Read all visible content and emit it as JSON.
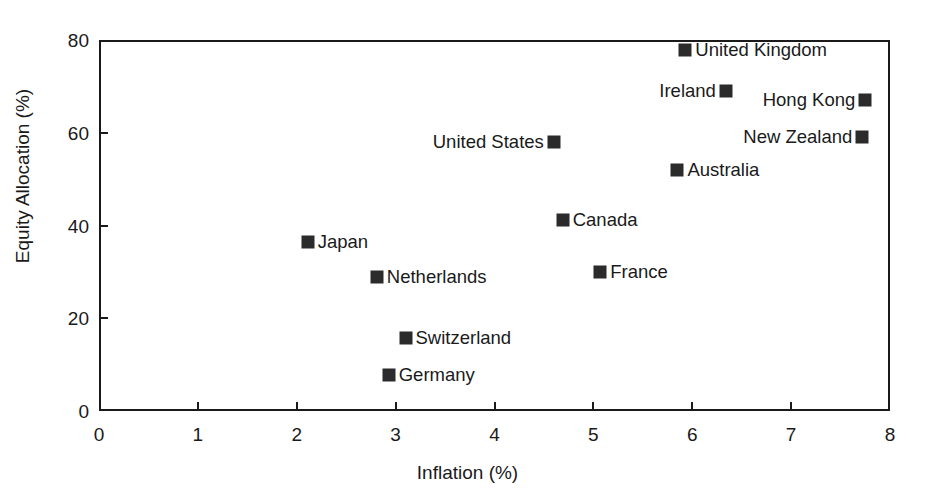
{
  "chart_data": {
    "type": "scatter",
    "title": "",
    "xlabel": "Inflation (%)",
    "ylabel": "Equity Allocation (%)",
    "xlim": [
      0,
      8
    ],
    "ylim": [
      0,
      80
    ],
    "xticks": [
      "0",
      "1",
      "2",
      "3",
      "4",
      "5",
      "6",
      "7",
      "8"
    ],
    "yticks": [
      "0",
      "20",
      "40",
      "60",
      "80"
    ],
    "grid": false,
    "legend": "none",
    "marker_shape": "square",
    "marker_color": "#2b2b2b",
    "points": [
      {
        "label": "United Kingdom",
        "x": 5.93,
        "y": 77.8,
        "label_side": "right"
      },
      {
        "label": "Ireland",
        "x": 6.34,
        "y": 69.0,
        "label_side": "left"
      },
      {
        "label": "Hong Kong",
        "x": 7.75,
        "y": 67.0,
        "label_side": "left"
      },
      {
        "label": "New Zealand",
        "x": 7.72,
        "y": 59.0,
        "label_side": "left"
      },
      {
        "label": "United States",
        "x": 4.6,
        "y": 58.0,
        "label_side": "left"
      },
      {
        "label": "Australia",
        "x": 5.85,
        "y": 52.0,
        "label_side": "right"
      },
      {
        "label": "Canada",
        "x": 4.69,
        "y": 41.2,
        "label_side": "right"
      },
      {
        "label": "Japan",
        "x": 2.11,
        "y": 36.5,
        "label_side": "right"
      },
      {
        "label": "France",
        "x": 5.07,
        "y": 30.0,
        "label_side": "right"
      },
      {
        "label": "Netherlands",
        "x": 2.81,
        "y": 29.0,
        "label_side": "right"
      },
      {
        "label": "Switzerland",
        "x": 3.1,
        "y": 15.7,
        "label_side": "right"
      },
      {
        "label": "Germany",
        "x": 2.93,
        "y": 7.7,
        "label_side": "right"
      }
    ]
  }
}
